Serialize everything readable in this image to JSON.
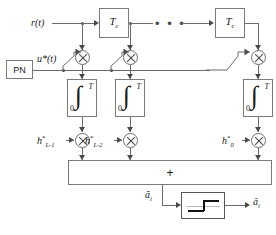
{
  "figure": {
    "kind": "block-diagram",
    "title_text": ""
  },
  "signals": {
    "input_label": "r(t)",
    "despread_label": "u*(t)",
    "soft_output_label": "ã",
    "soft_output_sub": "i",
    "hard_output_label": "â",
    "hard_output_sub": "i"
  },
  "blocks": {
    "pn_generator": {
      "label": "PN",
      "name": "pn-generator"
    },
    "delays": [
      {
        "label": "T",
        "sub": "c"
      },
      {
        "label": "T",
        "sub": "c"
      }
    ],
    "ellipsis": "• • •",
    "integrators": [
      {
        "sign": "∫",
        "upper": "T",
        "lower": "0"
      },
      {
        "sign": "∫",
        "upper": "T",
        "lower": "0"
      },
      {
        "sign": "∫",
        "upper": "T",
        "lower": "0"
      }
    ],
    "summation": {
      "label": "+",
      "name": "summation-node"
    },
    "decision": {
      "name": "signum-decision-device",
      "label": ""
    }
  },
  "taps": [
    {
      "coeff": "h",
      "star": "*",
      "sub": "L-1"
    },
    {
      "coeff": "h",
      "star": "*",
      "sub": "L-2"
    },
    {
      "coeff": "h",
      "star": "*",
      "sub": "0"
    }
  ],
  "multipliers": {
    "symbol": "⊗",
    "count_despread": 3,
    "count_weight": 3
  },
  "colors": {
    "line": "#6b6b6b",
    "dark_line": "#4a4a4a",
    "box_border": "#7a7a7a",
    "text": "#1a1a1a",
    "background": "#ffffff"
  }
}
